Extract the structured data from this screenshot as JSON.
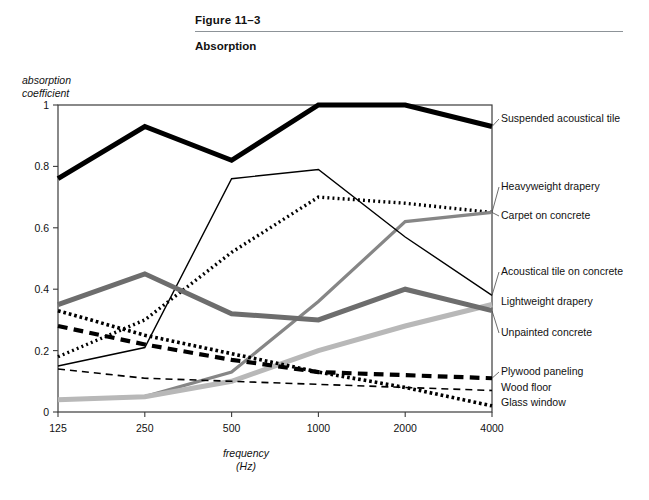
{
  "header": {
    "figure_number": "Figure 11–3",
    "title": "Absorption"
  },
  "axes": {
    "ylabel": "absorption\ncoefficient",
    "xlabel": "frequency\n(Hz)"
  },
  "chart_data": {
    "type": "line",
    "title": "Absorption",
    "xlabel": "frequency (Hz)",
    "ylabel": "absorption coefficient",
    "categories": [
      "125",
      "250",
      "500",
      "1000",
      "2000",
      "4000"
    ],
    "x_tick_labels": [
      "125",
      "250",
      "500",
      "1000",
      "2000",
      "4000"
    ],
    "y_tick_labels": [
      "0",
      "0.2",
      "0.4",
      "0.6",
      "0.8",
      "1"
    ],
    "y_ticks": [
      0,
      0.2,
      0.4,
      0.6,
      0.8,
      1
    ],
    "ylim": [
      0,
      1
    ],
    "grid": false,
    "legend_position": "right-of-plot-inline",
    "series": [
      {
        "name": "Suspended acoustical tile",
        "values": [
          0.76,
          0.93,
          0.82,
          1.0,
          1.0,
          0.93
        ],
        "color": "#000000",
        "style": "solid",
        "width": 5.0,
        "label_y": 122
      },
      {
        "name": "Heavyweight drapery",
        "values": [
          0.18,
          0.3,
          0.52,
          0.7,
          0.68,
          0.65
        ],
        "color": "#000000",
        "style": "dotted",
        "width": 3.4,
        "label_y": 190
      },
      {
        "name": "Carpet on concrete",
        "values": [
          0.04,
          0.05,
          0.13,
          0.36,
          0.62,
          0.65
        ],
        "color": "#868686",
        "style": "solid",
        "width": 3.2,
        "label_y": 219
      },
      {
        "name": "Acoustical tile on concrete",
        "values": [
          0.15,
          0.21,
          0.76,
          0.79,
          0.57,
          0.38
        ],
        "color": "#000000",
        "style": "solid",
        "width": 1.4,
        "label_y": 275
      },
      {
        "name": "Lightweight drapery",
        "values": [
          0.04,
          0.05,
          0.1,
          0.2,
          0.28,
          0.35
        ],
        "color": "#b8b8b8",
        "style": "solid",
        "width": 5.0,
        "label_y": 305
      },
      {
        "name": "Unpainted concrete",
        "values": [
          0.35,
          0.45,
          0.32,
          0.3,
          0.4,
          0.33
        ],
        "color": "#6d6d6d",
        "style": "solid",
        "width": 5.0,
        "label_y": 336
      },
      {
        "name": "Plywood paneling",
        "values": [
          0.28,
          0.22,
          0.17,
          0.13,
          0.12,
          0.11
        ],
        "color": "#000000",
        "style": "dashed-thick",
        "width": 4.2,
        "label_y": 375
      },
      {
        "name": "Wood floor",
        "values": [
          0.14,
          0.11,
          0.1,
          0.09,
          0.08,
          0.07
        ],
        "color": "#000000",
        "style": "dashed-thin",
        "width": 1.6,
        "label_y": 391
      },
      {
        "name": "Glass window",
        "values": [
          0.33,
          0.25,
          0.19,
          0.13,
          0.08,
          0.02
        ],
        "color": "#000000",
        "style": "dotted-square",
        "width": 3.6,
        "label_y": 406
      }
    ]
  }
}
